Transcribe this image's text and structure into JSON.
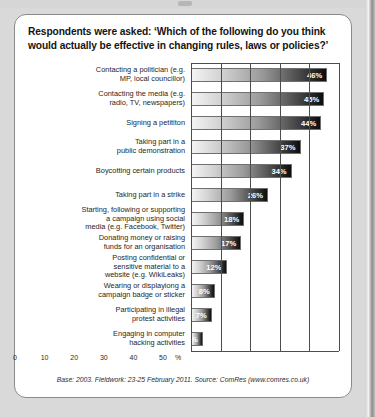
{
  "figure": {
    "title": "Respondents were asked: ‘Which of the following do you think would actually be effective in changing rules, laws or policies?’",
    "footer": "Base: 2003. Fieldwork: 23-25 February 2011. Source: ComRes (www.comres.co.uk)",
    "axis_unit": "%"
  },
  "chart_data": {
    "type": "bar",
    "orientation": "horizontal",
    "title": "Respondents were asked: ‘Which of the following do you think would actually be effective in changing rules, laws or policies?’",
    "xlabel": "%",
    "ylabel": "",
    "xlim": [
      0,
      50
    ],
    "xticks": [
      0,
      10,
      20,
      30,
      40,
      50
    ],
    "xtick_labels": [
      "0",
      "10",
      "20",
      "30",
      "40",
      "50"
    ],
    "grid": true,
    "legend": false,
    "value_suffix": "%",
    "categories": [
      "Contacting a politician (e.g.\nMP, local councillor)",
      "Contacting the media (e.g.\nradio, TV, newspapers)",
      "Signing a petititon",
      "Taking part in a\npublic demonstration",
      "Boycotting certain products",
      "Taking part in a strike",
      "Starting, following or supporting\na campaign using social\nmedia (e.g. Facebook, Twitter)",
      "Donating money or raising\nfunds for an organisation",
      "Posting confidential or\nsensitive material to a\nwebsite (e.g. WikiLeaks)",
      "Wearing or displayiong a\ncampaign badge or sticker",
      "Participating in illegal\nprotest activities",
      "Engaging in computer\nhacking activities"
    ],
    "values": [
      46,
      45,
      44,
      37,
      34,
      26,
      18,
      17,
      12,
      8,
      7,
      4
    ],
    "value_labels": [
      "46%",
      "45%",
      "44%",
      "37%",
      "34%",
      "26%",
      "18%",
      "17%",
      "12%",
      "8%",
      "7%",
      "4%"
    ],
    "annotations": [
      "Base: 2003. Fieldwork: 23-25 February 2011. Source: ComRes (www.comres.co.uk)"
    ]
  },
  "colors": {
    "bar_start": "#f4f4f4",
    "bar_end": "#0c0c0c",
    "value_text": "#ffffff",
    "frame": "#8a8a8a",
    "background": "#ffffff"
  }
}
